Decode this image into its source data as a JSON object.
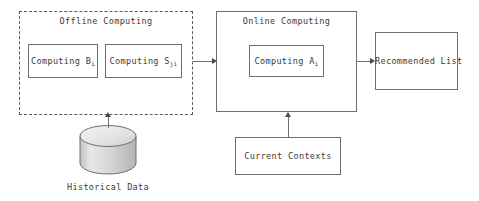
{
  "diagram": {
    "type": "flow-diagram",
    "background_color": "#ffffff",
    "stroke_color": "#6e6e6e",
    "text_color": "#3a3a3a",
    "groups": [
      {
        "id": "offline",
        "title": "Offline Computing",
        "border_style": "dashed"
      },
      {
        "id": "online",
        "title": "Online Computing",
        "border_style": "solid"
      }
    ],
    "nodes": {
      "computing_b": {
        "text": "Computing B",
        "subscript": "i"
      },
      "computing_s": {
        "text": "Computing S",
        "subscript": "ji"
      },
      "computing_a": {
        "text": "Computing A",
        "subscript": "i"
      },
      "recommended_list": {
        "text": "Recommended List"
      },
      "current_contexts": {
        "text": "Current Contexts"
      },
      "historical_data": {
        "text": "Historical Data",
        "shape": "cylinder"
      }
    },
    "edges": [
      {
        "from": "offline",
        "to": "online",
        "direction": "right"
      },
      {
        "from": "online",
        "to": "recommended_list",
        "direction": "right"
      },
      {
        "from": "historical_data",
        "to": "offline",
        "direction": "up"
      },
      {
        "from": "current_contexts",
        "to": "online",
        "direction": "up"
      }
    ]
  }
}
